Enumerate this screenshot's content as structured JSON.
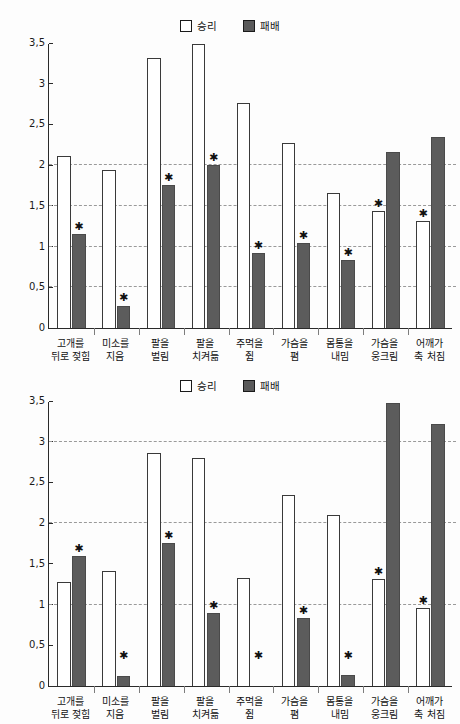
{
  "figure": {
    "categories": [
      "고개를\n뒤로 젖힘",
      "미소를\n지음",
      "팔을\n벌림",
      "팔을\n치켜듦",
      "주먹을\n쥠",
      "가슴을\n폄",
      "몸통을\n내밈",
      "가슴을\n웅크림",
      "어깨가\n축 처짐"
    ],
    "legend": {
      "win_label": "승리",
      "lose_label": "패배",
      "win_color": "#ffffff",
      "lose_color": "#5c5c5c"
    },
    "yticks": [
      "0",
      "0,5",
      "1",
      "1,5",
      "2",
      "2,5",
      "3",
      "3,5"
    ],
    "ytick_values": [
      0,
      0.5,
      1,
      1.5,
      2,
      2.5,
      3,
      3.5
    ]
  },
  "chart_data": [
    {
      "type": "bar",
      "title": "",
      "xlabel": "",
      "ylabel": "",
      "ylim": [
        0,
        3.5
      ],
      "grid": true,
      "gridlines": [
        0.5,
        1,
        1.5,
        2
      ],
      "legend_position": "top-center",
      "categories": [
        "고개를 뒤로 젖힘",
        "미소를 지음",
        "팔을 벌림",
        "팔을 치켜듦",
        "주먹을 쥠",
        "가슴을 폄",
        "몸통을 내밈",
        "가슴을 웅크림",
        "어깨가 축 처짐"
      ],
      "series": [
        {
          "name": "승리",
          "values": [
            2.11,
            1.94,
            3.31,
            3.49,
            2.76,
            2.27,
            1.66,
            1.44,
            1.32
          ],
          "significant": [
            false,
            false,
            false,
            false,
            false,
            false,
            false,
            true,
            true
          ]
        },
        {
          "name": "패배",
          "values": [
            1.15,
            0.27,
            1.76,
            2.0,
            0.92,
            1.05,
            0.83,
            2.16,
            2.34
          ],
          "significant": [
            true,
            true,
            true,
            true,
            true,
            true,
            true,
            false,
            false
          ]
        }
      ],
      "annotations": "* marks significant difference"
    },
    {
      "type": "bar",
      "title": "",
      "xlabel": "",
      "ylabel": "",
      "ylim": [
        0,
        3.5
      ],
      "grid": true,
      "gridlines": [
        1,
        2,
        3
      ],
      "legend_position": "top-center",
      "categories": [
        "고개를 뒤로 젖힘",
        "미소를 지음",
        "팔을 벌림",
        "팔을 치켜듦",
        "주먹을 쥠",
        "가슴을 폄",
        "몸통을 내밈",
        "가슴을 웅크림",
        "어깨가 축 처짐"
      ],
      "series": [
        {
          "name": "승리",
          "values": [
            1.28,
            1.41,
            2.86,
            2.8,
            1.33,
            2.35,
            2.1,
            1.31,
            0.96
          ],
          "significant": [
            false,
            false,
            false,
            false,
            false,
            false,
            false,
            true,
            true
          ]
        },
        {
          "name": "패배",
          "values": [
            1.6,
            0.12,
            1.76,
            0.9,
            0.0,
            0.83,
            0.14,
            3.48,
            3.22
          ],
          "significant": [
            true,
            true,
            true,
            true,
            true,
            true,
            true,
            false,
            false
          ]
        }
      ],
      "annotations": "* marks significant difference"
    }
  ],
  "star_symbol": "✱"
}
